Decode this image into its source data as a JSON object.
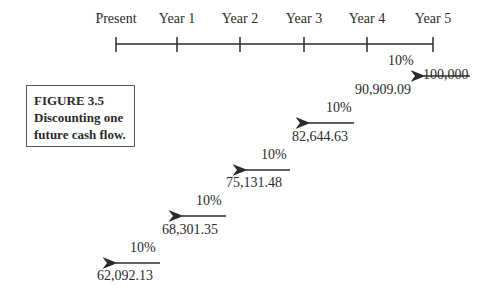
{
  "timeline": {
    "labels": [
      "Present",
      "Year 1",
      "Year 2",
      "Year 3",
      "Year 4",
      "Year 5"
    ]
  },
  "caption": {
    "line1": "FIGURE 3.5",
    "line2": "Discounting one",
    "line3": "future cash flow."
  },
  "future_value": "100,000",
  "rate": "10%",
  "steps": [
    {
      "rate": "10%",
      "value": "90,909.09"
    },
    {
      "rate": "10%",
      "value": "82,644.63"
    },
    {
      "rate": "10%",
      "value": "75,131.48"
    },
    {
      "rate": "10%",
      "value": "68,301.35"
    },
    {
      "rate": "10%",
      "value": "62,092.13"
    }
  ],
  "colors": {
    "line": "#2b2b2b",
    "box_border": "#555555"
  }
}
